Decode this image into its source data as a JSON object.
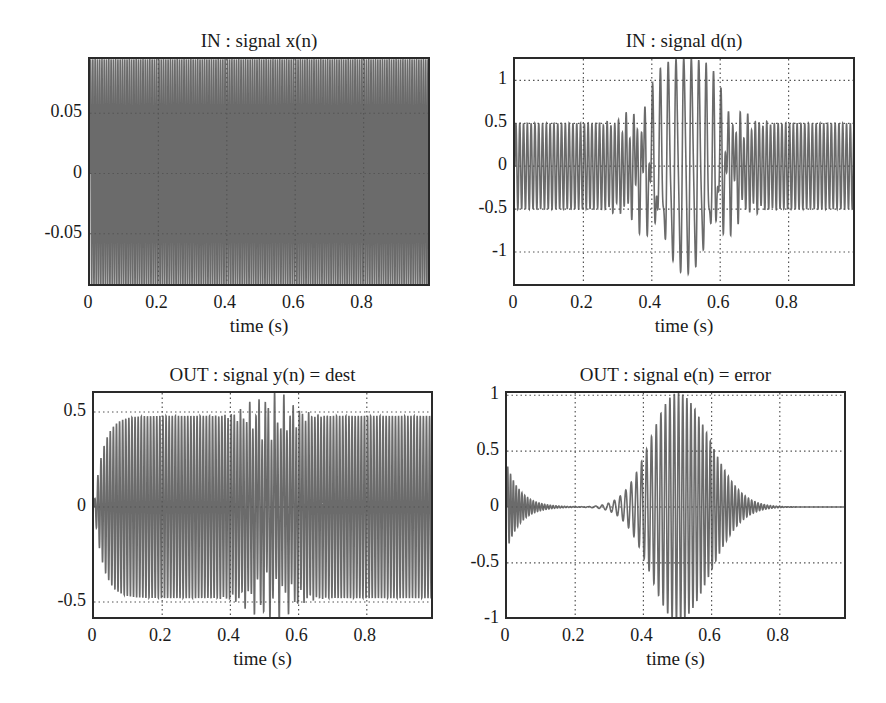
{
  "figure": {
    "line_color": "#6b6b6b",
    "grid_color": "#555555"
  },
  "chart_data": [
    {
      "id": "x",
      "type": "line",
      "title": "IN : signal x(n)",
      "xlabel": "time (s)",
      "ylabel": "",
      "xlim": [
        0,
        1
      ],
      "ylim": [
        -0.095,
        0.095
      ],
      "xticks": [
        0,
        0.2,
        0.4,
        0.6,
        0.8
      ],
      "xtick_labels": [
        "0",
        "0.2",
        "0.4",
        "0.6",
        "0.8"
      ],
      "yticks": [
        0.05,
        0,
        -0.05
      ],
      "ytick_labels": [
        "0.05",
        "0",
        "-0.05"
      ],
      "grid": true,
      "signal": {
        "kind": "constant_sine",
        "amplitude": 0.095,
        "frequency_hz": 150
      },
      "box": {
        "left": 88,
        "top": 57,
        "right": 430,
        "bottom": 286
      }
    },
    {
      "id": "d",
      "type": "line",
      "title": "IN : signal d(n)",
      "xlabel": "time (s)",
      "ylabel": "",
      "xlim": [
        0,
        1
      ],
      "ylim": [
        -1.42,
        1.25
      ],
      "xticks": [
        0,
        0.2,
        0.4,
        0.6,
        0.8
      ],
      "xtick_labels": [
        "0",
        "0.2",
        "0.4",
        "0.6",
        "0.8"
      ],
      "yticks": [
        1,
        0.5,
        0,
        -0.5,
        -1
      ],
      "ytick_labels": [
        "1",
        "0.5",
        "0",
        "-0.5",
        "-1"
      ],
      "grid": true,
      "signal": {
        "kind": "sine_plus_burst",
        "base_amplitude": 0.5,
        "base_frequency_hz": 90,
        "burst_center_s": 0.5,
        "burst_peak": 1.4,
        "burst_width_s": 0.12
      },
      "box": {
        "left": 513,
        "top": 57,
        "right": 855,
        "bottom": 286
      }
    },
    {
      "id": "y",
      "type": "line",
      "title": "OUT : signal y(n) = dest",
      "xlabel": "time (s)",
      "ylabel": "",
      "xlim": [
        0,
        1
      ],
      "ylim": [
        -0.6,
        0.6
      ],
      "xticks": [
        0,
        0.2,
        0.4,
        0.6,
        0.8
      ],
      "xtick_labels": [
        "0",
        "0.2",
        "0.4",
        "0.6",
        "0.8"
      ],
      "yticks": [
        0.5,
        0,
        -0.5
      ],
      "ytick_labels": [
        "0.5",
        "0",
        "-0.5"
      ],
      "grid": true,
      "signal": {
        "kind": "rising_sine_plus_burst",
        "base_amplitude": 0.48,
        "rise_time_s": 0.08,
        "burst_center_s": 0.52,
        "burst_peak": 0.62
      },
      "box": {
        "left": 92,
        "top": 391,
        "right": 433,
        "bottom": 619
      }
    },
    {
      "id": "e",
      "type": "line",
      "title": "OUT : signal e(n) = error",
      "xlabel": "time (s)",
      "ylabel": "",
      "xlim": [
        0,
        1
      ],
      "ylim": [
        -1.02,
        1.02
      ],
      "xticks": [
        0,
        0.2,
        0.4,
        0.6,
        0.8
      ],
      "xtick_labels": [
        "0",
        "0.2",
        "0.4",
        "0.6",
        "0.8"
      ],
      "yticks": [
        1,
        0.5,
        0,
        -0.5,
        -1
      ],
      "ytick_labels": [
        "1",
        "0.5",
        "0",
        "-0.5",
        "-1"
      ],
      "grid": true,
      "signal": {
        "kind": "transient_plus_chirp_burst",
        "initial_transient_amplitude": 0.38,
        "transient_decay_s": 0.04,
        "burst_center_s": 0.5,
        "burst_peak": 1.02
      },
      "box": {
        "left": 505,
        "top": 391,
        "right": 846,
        "bottom": 619
      }
    }
  ]
}
